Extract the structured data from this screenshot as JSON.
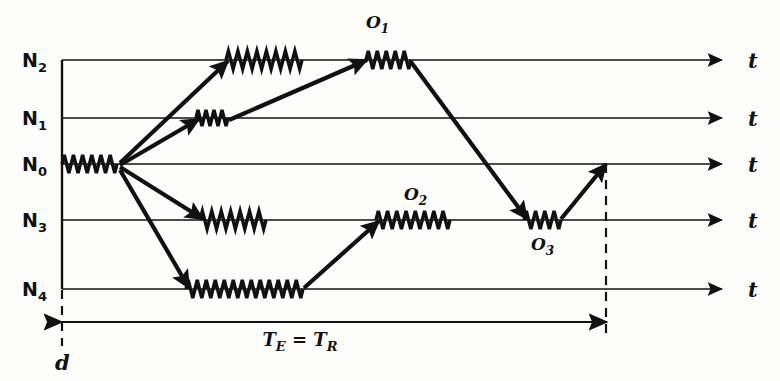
{
  "figure": {
    "kind": "energy-level-transition-diagram",
    "background_color": "#fdfdfb",
    "ink_color": "#111111",
    "width": 780,
    "height": 381
  },
  "levels": [
    {
      "id": "N2",
      "base": "N",
      "sub": "2",
      "y": 60,
      "label_x": 22,
      "line_x1": 62,
      "line_x2": 722
    },
    {
      "id": "N1",
      "base": "N",
      "sub": "1",
      "y": 118,
      "label_x": 22,
      "line_x1": 62,
      "line_x2": 722
    },
    {
      "id": "N0",
      "base": "N",
      "sub": "0",
      "y": 164,
      "label_x": 22,
      "line_x1": 62,
      "line_x2": 722
    },
    {
      "id": "N3",
      "base": "N",
      "sub": "3",
      "y": 220,
      "label_x": 22,
      "line_x1": 62,
      "line_x2": 722
    },
    {
      "id": "N4",
      "base": "N",
      "sub": "4",
      "y": 289,
      "label_x": 22,
      "line_x1": 62,
      "line_x2": 722
    }
  ],
  "time_axis_labels": [
    {
      "text": "t",
      "x": 748,
      "y": 60
    },
    {
      "text": "t",
      "x": 748,
      "y": 118
    },
    {
      "text": "t",
      "x": 748,
      "y": 164
    },
    {
      "text": "t",
      "x": 748,
      "y": 220
    },
    {
      "text": "t",
      "x": 748,
      "y": 289
    }
  ],
  "wiggles": [
    {
      "name": "wiggle-N0-initial",
      "y": 164,
      "x1": 62,
      "x2": 117,
      "cycles": 6,
      "amp": 9
    },
    {
      "name": "wiggle-N2-first",
      "y": 60,
      "x1": 226,
      "x2": 302,
      "cycles": 8,
      "amp": 9
    },
    {
      "name": "wiggle-N1",
      "y": 118,
      "x1": 196,
      "x2": 228,
      "cycles": 4,
      "amp": 8
    },
    {
      "name": "wiggle-N3-first",
      "y": 220,
      "x1": 200,
      "x2": 266,
      "cycles": 7,
      "amp": 9
    },
    {
      "name": "wiggle-N4",
      "y": 289,
      "x1": 186,
      "x2": 303,
      "cycles": 13,
      "amp": 9
    },
    {
      "name": "wiggle-O1",
      "y": 60,
      "x1": 366,
      "x2": 411,
      "cycles": 5,
      "amp": 9
    },
    {
      "name": "wiggle-O2",
      "y": 220,
      "x1": 376,
      "x2": 450,
      "cycles": 8,
      "amp": 9
    },
    {
      "name": "wiggle-O3",
      "y": 220,
      "x1": 524,
      "x2": 561,
      "cycles": 4,
      "amp": 9
    }
  ],
  "transitions": [
    {
      "name": "transition-N0-to-N2",
      "x1": 120,
      "y1": 163,
      "x2": 228,
      "y2": 61,
      "arrow": "end"
    },
    {
      "name": "transition-N0-to-N1",
      "x1": 120,
      "y1": 165,
      "x2": 199,
      "y2": 119,
      "arrow": "end"
    },
    {
      "name": "transition-N0-to-N3",
      "x1": 120,
      "y1": 167,
      "x2": 203,
      "y2": 219,
      "arrow": "end"
    },
    {
      "name": "transition-N0-to-N4",
      "x1": 120,
      "y1": 170,
      "x2": 189,
      "y2": 288,
      "arrow": "end"
    },
    {
      "name": "transition-N1-to-O1",
      "x1": 229,
      "y1": 120,
      "x2": 367,
      "y2": 60,
      "arrow": "end"
    },
    {
      "name": "transition-O1-to-O3",
      "x1": 411,
      "y1": 62,
      "x2": 527,
      "y2": 219,
      "arrow": "end"
    },
    {
      "name": "transition-N4-to-O2",
      "x1": 304,
      "y1": 288,
      "x2": 379,
      "y2": 221,
      "arrow": "end"
    },
    {
      "name": "transition-O3-to-N0",
      "x1": 561,
      "y1": 219,
      "x2": 606,
      "y2": 164,
      "arrow": "end"
    }
  ],
  "emission_labels": [
    {
      "id": "O1",
      "base": "O",
      "sub": "1",
      "x": 366,
      "y": 28,
      "name": "emission-label-o1"
    },
    {
      "id": "O2",
      "base": "O",
      "sub": "2",
      "x": 404,
      "y": 200,
      "name": "emission-label-o2"
    },
    {
      "id": "O3",
      "base": "O",
      "sub": "3",
      "x": 531,
      "y": 250,
      "name": "emission-label-o3"
    }
  ],
  "dashed_lines": [
    {
      "name": "dashed-line-start",
      "x": 62,
      "y1": 290,
      "y2": 346
    },
    {
      "name": "dashed-line-end",
      "x": 606,
      "y1": 164,
      "y2": 340
    }
  ],
  "measurement": {
    "name": "time-span-measure",
    "x1": 62,
    "x2": 607,
    "y": 322,
    "label_base_1": "T",
    "label_sub_1": "E",
    "label_eq": " = ",
    "label_base_2": "T",
    "label_sub_2": "R",
    "label_full": "TE = TR",
    "label_x": 300,
    "label_y": 346
  },
  "origin_label": {
    "name": "origin-depth-label",
    "text": "d",
    "x": 55,
    "y": 370
  }
}
